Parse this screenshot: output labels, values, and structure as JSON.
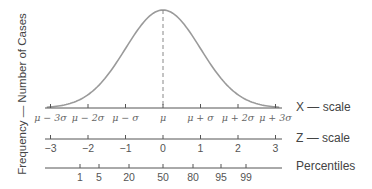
{
  "diagram": {
    "y_axis_label": "Frequency — Number of Cases",
    "curve_color": "#9a9a9a",
    "axis_color": "#555555",
    "mean_line_style": "dashed",
    "scales": {
      "x": {
        "name": "X — scale",
        "ticks": [
          "μ − 3σ",
          "μ − 2σ",
          "μ − σ",
          "μ",
          "μ + σ",
          "μ + 2σ",
          "μ + 3σ"
        ]
      },
      "z": {
        "name": "Z — scale",
        "ticks": [
          "−3",
          "−2",
          "−1",
          "0",
          "1",
          "2",
          "3"
        ]
      },
      "percentiles": {
        "name": "Percentiles",
        "ticks": [
          "1",
          "5",
          "20",
          "50",
          "80",
          "95",
          "99"
        ]
      }
    }
  },
  "chart_data": {
    "type": "line",
    "ylabel": "Frequency — Number of Cases",
    "xlabel": "X — scale",
    "x": [
      -3,
      -2,
      -1,
      0,
      1,
      2,
      3
    ],
    "series": [
      {
        "name": "normal curve",
        "values": [
          0.004,
          0.054,
          0.242,
          0.399,
          0.242,
          0.054,
          0.004
        ]
      }
    ],
    "x_tick_labels": [
      "μ − 3σ",
      "μ − 2σ",
      "μ − σ",
      "μ",
      "μ + σ",
      "μ + 2σ",
      "μ + 3σ"
    ],
    "z_tick_labels": [
      "-3",
      "-2",
      "-1",
      "0",
      "1",
      "2",
      "3"
    ],
    "percentile_ticks": [
      1,
      5,
      20,
      50,
      80,
      95,
      99
    ],
    "grid": false
  }
}
